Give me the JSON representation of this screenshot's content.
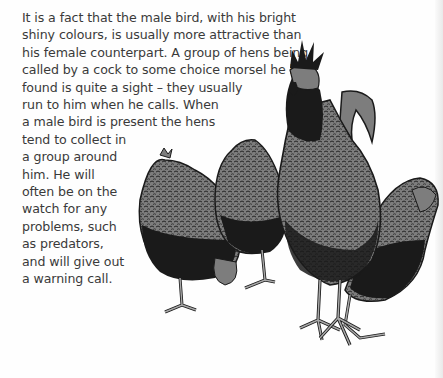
{
  "body_text": {
    "lines": [
      "It is a fact that the male bird, with his bright",
      "shiny colours, is usually more attractive than",
      "his female counterpart. A group of hens being",
      "called by a cock to some choice morsel he has",
      "found is quite a sight – they usually",
      "run to him when he calls. When",
      "a male bird is present the hens",
      "tend to collect in",
      "a group around",
      "him. He will",
      "often be on the",
      "watch for any",
      "problems, such",
      "as predators,",
      "and will give out",
      "a warning call."
    ]
  },
  "illustration": {
    "subject": "rooster-with-hens",
    "colors": {
      "ink": "#1a1a1a",
      "mid": "#7d7d7d",
      "light": "#a8a8a8"
    }
  }
}
